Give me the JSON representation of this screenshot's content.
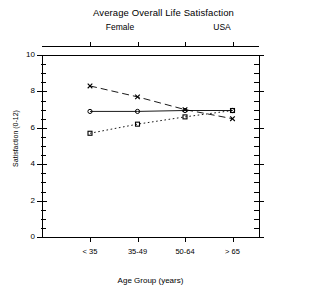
{
  "header": {
    "title": "Average Overall Life Satisfaction",
    "panel_label_left": "Female",
    "panel_label_right": "USA"
  },
  "axes": {
    "ylabel": "Satisfaction (0-12)",
    "xlabel": "Age Group (years)",
    "ytick_labels": [
      "10",
      "8",
      "6",
      "4",
      "2",
      "0"
    ],
    "xtick_labels": [
      "< 35",
      "35-49",
      "50-64",
      "> 65"
    ]
  },
  "chart_data": {
    "type": "line",
    "title": "Average Overall Life Satisfaction",
    "subtitle_left": "Female",
    "subtitle_right": "USA",
    "xlabel": "Age Group (years)",
    "ylabel": "Satisfaction (0-12)",
    "categories": [
      "< 35",
      "35-49",
      "50-64",
      "> 65"
    ],
    "ylim": [
      0,
      10
    ],
    "ytick_values": [
      10,
      8,
      6,
      4,
      2,
      0
    ],
    "yminor_step": 0.5,
    "grid": false,
    "legend": "none",
    "series": [
      {
        "name": "x-series",
        "marker": "x",
        "linestyle": "dashed",
        "color": "#000000",
        "values": [
          8.3,
          7.7,
          7.0,
          6.5
        ]
      },
      {
        "name": "circle-series",
        "marker": "circle",
        "linestyle": "solid",
        "color": "#000000",
        "values": [
          6.9,
          6.9,
          6.95,
          6.95
        ]
      },
      {
        "name": "square-series",
        "marker": "square",
        "linestyle": "dotted",
        "color": "#000000",
        "values": [
          5.7,
          6.2,
          6.6,
          6.95
        ]
      }
    ]
  }
}
